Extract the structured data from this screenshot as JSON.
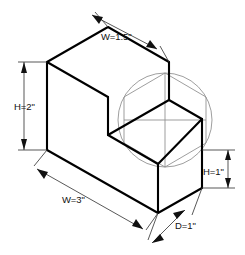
{
  "drawing": {
    "title": "Isometric step block with dimensions",
    "background_color": "#ffffff",
    "edge_color": "#000000",
    "construction_color": "#8d8d8d",
    "dimension_color": "#3a3a3a",
    "text_color": "#111111"
  },
  "dimensions": {
    "top_width": "W=1.5\"",
    "left_height": "H=2\"",
    "right_height": "H=1\"",
    "bottom_width": "W=3\"",
    "depth": "D=1\""
  },
  "labels": {
    "construction_circle": "construction-circle",
    "construction_hexagon": "construction-hexagon"
  }
}
